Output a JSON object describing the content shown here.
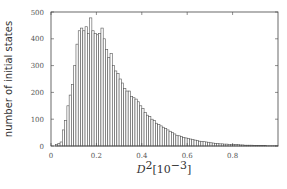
{
  "chart_data": {
    "type": "bar",
    "title": "",
    "xlabel": "D^2 [10^-3]",
    "xlabel_parts": {
      "base": "D",
      "sup": "2",
      "bracket_open": "[10",
      "bracket_sup": "−3",
      "bracket_close": "]"
    },
    "ylabel": "number of initial states",
    "xlim": [
      0,
      1.0
    ],
    "ylim": [
      0,
      500
    ],
    "xticks": [
      0,
      0.2,
      0.4,
      0.6,
      0.8
    ],
    "xtick_labels": [
      "0",
      "0.2",
      "0.4",
      "0.6",
      "0.8"
    ],
    "yticks": [
      0,
      100,
      200,
      300,
      400,
      500
    ],
    "ytick_labels": [
      "0",
      "100",
      "200",
      "300",
      "400",
      "500"
    ],
    "grid": false,
    "legend": null,
    "bin_width": 0.01,
    "bin_start": 0.0,
    "values": [
      0,
      0,
      5,
      10,
      15,
      60,
      95,
      150,
      190,
      230,
      300,
      380,
      430,
      440,
      430,
      445,
      420,
      478,
      430,
      420,
      415,
      420,
      440,
      400,
      360,
      330,
      345,
      300,
      280,
      270,
      250,
      235,
      215,
      205,
      205,
      185,
      180,
      175,
      165,
      150,
      140,
      125,
      115,
      110,
      100,
      95,
      85,
      80,
      75,
      70,
      65,
      60,
      55,
      50,
      45,
      40,
      38,
      35,
      32,
      30,
      28,
      26,
      24,
      22,
      20,
      18,
      17,
      16,
      15,
      14,
      12,
      11,
      10,
      9,
      8,
      8,
      7,
      7,
      6,
      6,
      5,
      5,
      5,
      4,
      4,
      3,
      3,
      3,
      3,
      2,
      2,
      2,
      2,
      2,
      2,
      1,
      1,
      1,
      1,
      1
    ],
    "colors": {
      "bar_fill": "#ffffff",
      "bar_edge": "#555555",
      "axis": "#444444",
      "text": "#444444"
    }
  }
}
